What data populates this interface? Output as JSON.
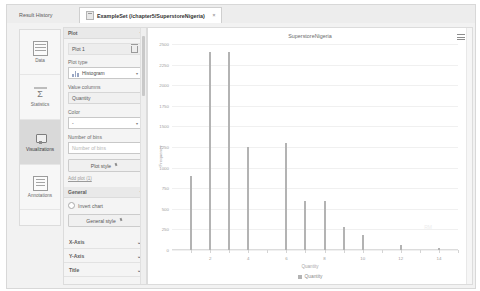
{
  "tabs": [
    {
      "label": "Result History",
      "active": false,
      "closable": false
    },
    {
      "label": "ExampleSet (/chapter5/SuperstoreNigeria)",
      "active": true,
      "closable": true,
      "close_glyph": "×"
    }
  ],
  "sidebar": {
    "items": [
      {
        "label": "Data",
        "icon": "table-icon",
        "selected": false
      },
      {
        "label": "Statistics",
        "icon": "sigma-icon",
        "selected": false
      },
      {
        "label": "Visualizations",
        "icon": "chart-icon",
        "selected": true
      },
      {
        "label": "Annotations",
        "icon": "notes-icon",
        "selected": false
      }
    ]
  },
  "options": {
    "plot_section": {
      "title": "Plot",
      "chevron": "⌃",
      "plot_name": "Plot 1",
      "delete_icon": "trash-icon",
      "plot_type_label": "Plot type",
      "plot_type_value": "Histogram",
      "value_columns_label": "Value columns",
      "value_columns_value": "Quantity",
      "color_label": "Color",
      "color_value": "-",
      "bins_label": "Number of bins",
      "bins_placeholder": "Number of bins",
      "plot_style_button": "Plot style",
      "add_plot_link": "Add plot (1)"
    },
    "general_section": {
      "title": "General",
      "chevron": "⌃",
      "invert_chart_label": "Invert chart",
      "general_style_button": "General style"
    },
    "collapsed_sections": [
      {
        "title": "X-Axis",
        "chevron": "⌄"
      },
      {
        "title": "Y-Axis",
        "chevron": "⌄"
      },
      {
        "title": "Title",
        "chevron": "⌄"
      }
    ]
  },
  "chart_panel": {
    "menu_icon": "hamburger-menu-icon",
    "watermark": "RM"
  },
  "chart_data": {
    "type": "bar",
    "title": "SuperstoreNigeria",
    "xlabel": "Quantity",
    "ylabel": "Frequency",
    "categories": [
      1,
      2,
      3,
      4,
      5,
      6,
      7,
      8,
      9,
      10,
      11,
      12,
      13,
      14
    ],
    "values": [
      900,
      2400,
      2400,
      1250,
      0,
      1300,
      600,
      600,
      280,
      180,
      0,
      60,
      0,
      30
    ],
    "series": [
      {
        "name": "Quantity",
        "values": [
          900,
          2400,
          2400,
          1250,
          0,
          1300,
          600,
          600,
          280,
          180,
          0,
          60,
          0,
          30
        ]
      }
    ],
    "ylim": [
      0,
      2500
    ],
    "xlim": [
      0,
      15
    ],
    "yticks": [
      0,
      250,
      500,
      750,
      1000,
      1250,
      1500,
      1750,
      2000,
      2250,
      2500
    ],
    "ytick_labels": [
      "0",
      "250",
      "500",
      "750",
      "1000",
      "1250",
      "1500",
      "1750",
      "2000",
      "2250",
      "2500"
    ],
    "xticks": [
      2,
      4,
      6,
      8,
      10,
      12,
      14
    ],
    "xtick_labels": [
      "2",
      "4",
      "6",
      "8",
      "10",
      "12",
      "14"
    ],
    "grid": true,
    "legend": [
      "Quantity"
    ],
    "legend_position": "bottom",
    "bar_color": "#b3b3b3"
  }
}
